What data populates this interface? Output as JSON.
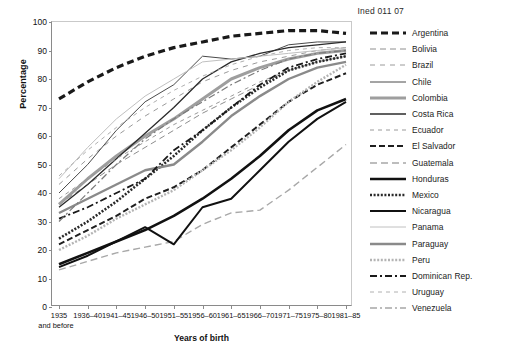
{
  "header": {
    "code": "Ined 011 07"
  },
  "chart_data": {
    "type": "line",
    "title": "",
    "xlabel": "Years of birth",
    "ylabel": "Percentage",
    "ylim": [
      0,
      100
    ],
    "yticks": [
      0,
      10,
      20,
      30,
      40,
      50,
      60,
      70,
      80,
      90,
      100
    ],
    "grid": false,
    "legend_position": "right",
    "categories": [
      "1935\nand before",
      "1936–40",
      "1941–45",
      "1946–50",
      "1951–55",
      "1956–60",
      "1961–65",
      "1966–70",
      "1971–75",
      "1975–80",
      "1981–85"
    ],
    "category_labels": [
      {
        "main": "1935",
        "sub": "and before"
      },
      {
        "main": "1936–40",
        "sub": ""
      },
      {
        "main": "1941–45",
        "sub": ""
      },
      {
        "main": "1946–50",
        "sub": ""
      },
      {
        "main": "1951–55",
        "sub": ""
      },
      {
        "main": "1956–60",
        "sub": ""
      },
      {
        "main": "1961–65",
        "sub": ""
      },
      {
        "main": "1966–70",
        "sub": ""
      },
      {
        "main": "1971–75",
        "sub": ""
      },
      {
        "main": "1975–80",
        "sub": ""
      },
      {
        "main": "1981–85",
        "sub": ""
      }
    ],
    "series": [
      {
        "name": "Argentina",
        "color": "#1a1a1a",
        "width": 3.2,
        "dash": "7,4",
        "values": [
          73,
          79,
          84,
          88,
          91,
          93,
          95,
          96,
          97,
          97,
          96
        ]
      },
      {
        "name": "Bolivia",
        "color": "#8e8e8e",
        "width": 1.0,
        "dash": "6,4",
        "values": [
          36,
          43,
          50,
          56,
          62,
          68,
          73,
          78,
          83,
          86,
          88
        ]
      },
      {
        "name": "Brazil",
        "color": "#9a9a9a",
        "width": 1.0,
        "dash": "5,5",
        "values": [
          43,
          52,
          60,
          67,
          73,
          79,
          83,
          86,
          88,
          90,
          91
        ]
      },
      {
        "name": "Chile",
        "color": "#4a4a4a",
        "width": 1.0,
        "dash": "0",
        "values": [
          40,
          50,
          62,
          72,
          78,
          88,
          87,
          88,
          92,
          93,
          93
        ]
      },
      {
        "name": "Colombia",
        "color": "#9e9e9e",
        "width": 3.0,
        "dash": "0",
        "values": [
          36,
          45,
          53,
          60,
          66,
          73,
          80,
          84,
          87,
          89,
          90
        ]
      },
      {
        "name": "Costa Rica",
        "color": "#2b2b2b",
        "width": 1.3,
        "dash": "0",
        "values": [
          35,
          43,
          52,
          61,
          70,
          80,
          86,
          89,
          91,
          92,
          93
        ]
      },
      {
        "name": "Ecuador",
        "color": "#9a9a9a",
        "width": 1.0,
        "dash": "4,4",
        "values": [
          38,
          45,
          52,
          58,
          64,
          69,
          74,
          79,
          83,
          86,
          88
        ]
      },
      {
        "name": "El Salvador",
        "color": "#1f1f1f",
        "width": 2.0,
        "dash": "6,3",
        "values": [
          22,
          27,
          32,
          38,
          42,
          48,
          56,
          64,
          72,
          78,
          82
        ]
      },
      {
        "name": "Guatemala",
        "color": "#a8a8a8",
        "width": 1.4,
        "dash": "7,4",
        "values": [
          13,
          16,
          19,
          21,
          23,
          29,
          33,
          34,
          41,
          49,
          57
        ]
      },
      {
        "name": "Honduras",
        "color": "#111111",
        "width": 2.6,
        "dash": "0",
        "values": [
          15,
          19,
          23,
          27,
          32,
          38,
          45,
          53,
          62,
          69,
          73
        ]
      },
      {
        "name": "Mexico",
        "color": "#2a2a2a",
        "width": 2.6,
        "dash": "2,1.6",
        "values": [
          24,
          30,
          37,
          45,
          53,
          62,
          70,
          77,
          83,
          86,
          88
        ]
      },
      {
        "name": "Nicaragua",
        "color": "#111111",
        "width": 2.0,
        "dash": "0",
        "values": [
          14,
          18,
          23,
          28,
          22,
          35,
          38,
          48,
          58,
          66,
          72
        ]
      },
      {
        "name": "Panama",
        "color": "#c0c0c0",
        "width": 1.0,
        "dash": "0",
        "values": [
          45,
          56,
          66,
          74,
          80,
          86,
          87,
          88,
          89,
          90,
          91
        ]
      },
      {
        "name": "Paraguay",
        "color": "#8a8a8a",
        "width": 2.4,
        "dash": "0",
        "values": [
          33,
          38,
          43,
          48,
          50,
          58,
          67,
          74,
          80,
          84,
          86
        ]
      },
      {
        "name": "Peru",
        "color": "#b4b4b4",
        "width": 2.4,
        "dash": "2,1.6",
        "values": [
          20,
          25,
          31,
          36,
          41,
          48,
          55,
          63,
          72,
          79,
          85
        ]
      },
      {
        "name": "Dominican Rep.",
        "color": "#1a1a1a",
        "width": 1.8,
        "dash": "7,3,2,3",
        "values": [
          31,
          35,
          40,
          45,
          55,
          62,
          70,
          78,
          84,
          87,
          89
        ]
      },
      {
        "name": "Uruguay",
        "color": "#b0b0b0",
        "width": 1.0,
        "dash": "4,4",
        "values": [
          46,
          55,
          63,
          70,
          76,
          81,
          85,
          88,
          90,
          91,
          91
        ]
      },
      {
        "name": "Venezuela",
        "color": "#7a7a7a",
        "width": 1.2,
        "dash": "7,3,2,3",
        "values": [
          30,
          40,
          50,
          59,
          66,
          72,
          78,
          83,
          87,
          89,
          90
        ]
      }
    ]
  }
}
